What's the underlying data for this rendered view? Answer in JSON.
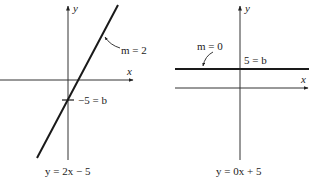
{
  "graphs": [
    {
      "id": "left",
      "axis_x_label": "x",
      "axis_y_label": "y",
      "slope_label": "m = 2",
      "intercept_label": "−5 = b",
      "equation": "y = 2x − 5",
      "slope": 2,
      "intercept": -5
    },
    {
      "id": "right",
      "axis_x_label": "x",
      "axis_y_label": "y",
      "slope_label": "m = 0",
      "intercept_label": "5 = b",
      "equation": "y = 0x + 5",
      "slope": 0,
      "intercept": 5
    }
  ],
  "colors": {
    "ink": "#222222",
    "background": "#ffffff"
  }
}
